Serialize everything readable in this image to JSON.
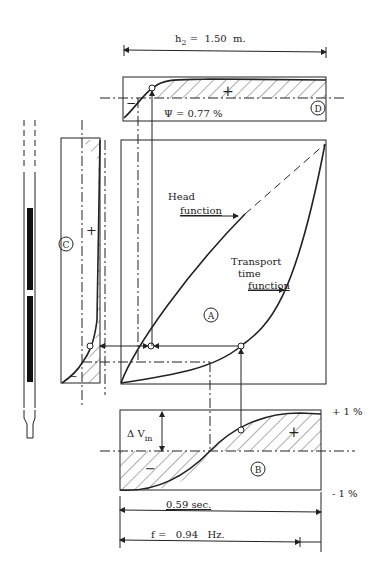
{
  "diagram": {
    "top_dimension": {
      "symbol": "h",
      "subscript": "2",
      "value": " =  1.50  m."
    },
    "panel_d": {
      "id": "D",
      "psi_label": "Ψ = 0.77 %",
      "sign_plus": "+",
      "sign_minus": "−"
    },
    "panel_c": {
      "id": "C",
      "sign_plus": "+",
      "sign_minus": "−"
    },
    "panel_a": {
      "id": "A",
      "head_function_line1": "Head",
      "head_function_line2": "function",
      "transport_line1": "Transport",
      "transport_line2": "time",
      "transport_line3": "function"
    },
    "panel_b": {
      "id": "B",
      "delta_v_symbol": "Δ V",
      "delta_v_subscript": "in",
      "sign_plus": "+",
      "sign_minus": "−",
      "upper_limit": "+ 1 %",
      "lower_limit": "- 1 %"
    },
    "period_dimension": "0.59 sec.",
    "frequency_dimension": "f =   0.94   Hz.",
    "colors": {
      "ink": "#222222",
      "background": "#ffffff"
    }
  }
}
